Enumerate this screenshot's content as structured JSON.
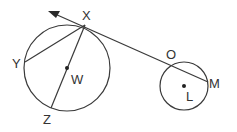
{
  "diagram": {
    "type": "geometry",
    "line_color": "#3a3a3a",
    "circles": [
      {
        "name": "W",
        "center": [
          67,
          68
        ],
        "radius": 43
      },
      {
        "name": "L",
        "center": [
          184,
          86
        ],
        "radius": 24
      }
    ],
    "points": {
      "X": {
        "label": "X",
        "pos": [
          85,
          25
        ]
      },
      "Y": {
        "label": "Y",
        "pos": [
          25,
          62
        ]
      },
      "Z": {
        "label": "Z",
        "pos": [
          51,
          108
        ]
      },
      "W": {
        "label": "W",
        "pos": [
          67,
          68
        ]
      },
      "O": {
        "label": "O",
        "pos": [
          172,
          63
        ]
      },
      "M": {
        "label": "M",
        "pos": [
          208,
          82
        ]
      },
      "L": {
        "label": "L",
        "pos": [
          184,
          86
        ]
      }
    },
    "segments": [
      "XY",
      "XZ (diameter through W)",
      "XM (secant through O and M)"
    ],
    "rays": [
      "ray from M through X with arrow"
    ]
  }
}
